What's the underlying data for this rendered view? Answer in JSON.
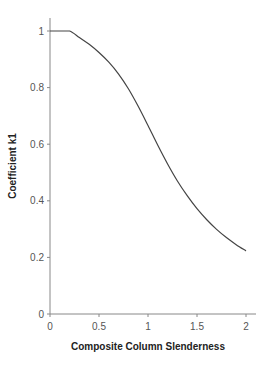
{
  "chart_data": {
    "type": "line",
    "title": "",
    "xlabel": "Composite Column Slenderness",
    "ylabel": "Coefficient k1",
    "xlim": [
      0,
      2
    ],
    "ylim": [
      0,
      1
    ],
    "x_ticks": [
      "0",
      "0.5",
      "1",
      "1.5",
      "2"
    ],
    "y_ticks": [
      "0",
      "0.2",
      "0.4",
      "0.6",
      "0.8",
      "1"
    ],
    "grid": false,
    "legend": null,
    "series": [
      {
        "name": "k1",
        "color": "#444444",
        "x": [
          0,
          0.1,
          0.2,
          0.3,
          0.4,
          0.5,
          0.6,
          0.7,
          0.8,
          0.9,
          1.0,
          1.1,
          1.2,
          1.3,
          1.4,
          1.5,
          1.6,
          1.7,
          1.8,
          1.9,
          2.0
        ],
        "y": [
          1.0,
          1.0,
          1.0,
          0.977,
          0.953,
          0.924,
          0.89,
          0.848,
          0.796,
          0.734,
          0.666,
          0.596,
          0.53,
          0.47,
          0.418,
          0.372,
          0.333,
          0.299,
          0.27,
          0.245,
          0.223
        ]
      }
    ]
  }
}
